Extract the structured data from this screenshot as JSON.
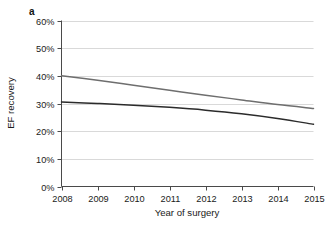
{
  "figure": {
    "panel_label": "a",
    "background": "#ffffff"
  },
  "chart_data": {
    "type": "line",
    "title": "",
    "xlabel": "Year of surgery",
    "ylabel": "EF recovery",
    "x": [
      2008,
      2009,
      2010,
      2011,
      2012,
      2013,
      2014,
      2015
    ],
    "xtick_labels": [
      "2008",
      "2009",
      "2010",
      "2011",
      "2012",
      "2013",
      "2014",
      "2015"
    ],
    "ytick_labels": [
      "0%",
      "10%",
      "20%",
      "30%",
      "40%",
      "50%",
      "60%"
    ],
    "ytick_values": [
      0,
      10,
      20,
      30,
      40,
      50,
      60
    ],
    "xlim": [
      2008,
      2015
    ],
    "ylim": [
      0,
      60
    ],
    "grid": "horizontal",
    "grid_color": "#d9d9d9",
    "legend": "none",
    "series": [
      {
        "name": "upper-line",
        "color": "#6e6e6e",
        "values": [
          40.0,
          38.4,
          36.6,
          34.8,
          33.0,
          31.3,
          29.6,
          28.2
        ]
      },
      {
        "name": "lower-line",
        "color": "#2b2b2b",
        "values": [
          30.5,
          30.0,
          29.4,
          28.6,
          27.6,
          26.3,
          24.6,
          22.5
        ]
      }
    ]
  }
}
